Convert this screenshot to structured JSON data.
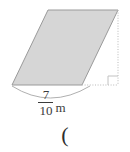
{
  "figure": {
    "kind": "parallelogram-with-height",
    "fill_color": "#d6d6d6",
    "stroke_color": "#9a9a9a",
    "dotted_color": "#b9b9b9",
    "brace_color": "#b0b0b0",
    "text_color": "#3b3b3b",
    "background_color": "#ffffff",
    "shape_points": "48,10 118,10 82,85 12,85",
    "height_line": "118,10 118,85",
    "base_extension": "82,85 118,85",
    "right_angle_marker": "108,85 108,76 118,76",
    "brace_path": "M 12,86 Q 50,110 90,86"
  },
  "labels": {
    "base_numerator": "7",
    "base_denominator": "10",
    "base_unit": "m",
    "trailing_text": "("
  }
}
